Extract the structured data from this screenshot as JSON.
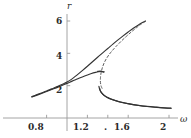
{
  "chart_data": {
    "type": "line",
    "title": "",
    "subtitle": "",
    "xlabel": "ω",
    "ylabel": "r",
    "xlim": [
      0.65,
      2.05
    ],
    "ylim": [
      0,
      6.9
    ],
    "grid": false,
    "legend": "none",
    "xticks": [
      0.8,
      1.2,
      1.4,
      1.6,
      2.0
    ],
    "xticklabels": [
      "0.8",
      "1.2",
      ".",
      "1.6",
      "2"
    ],
    "yticks": [
      2,
      4,
      6
    ],
    "yticklabels": [
      "2",
      "4",
      "6"
    ],
    "y_axis_at_x": 1.0,
    "x_axis_at_y": 0,
    "annotations": [],
    "series": [
      {
        "name": "lower-stable-branch",
        "style": "solid",
        "color": "#333333",
        "points": [
          [
            0.655,
            1.3
          ],
          [
            0.7,
            1.4
          ],
          [
            0.75,
            1.52
          ],
          [
            0.8,
            1.64
          ],
          [
            0.85,
            1.76
          ],
          [
            0.9,
            1.88
          ],
          [
            0.95,
            2.01
          ],
          [
            1.0,
            2.14
          ],
          [
            1.05,
            2.28
          ],
          [
            1.1,
            2.41
          ],
          [
            1.15,
            2.54
          ],
          [
            1.2,
            2.66
          ],
          [
            1.24,
            2.75
          ],
          [
            1.28,
            2.82
          ],
          [
            1.31,
            2.86
          ],
          [
            1.335,
            2.875
          ],
          [
            1.35,
            2.87
          ],
          [
            1.365,
            2.855
          ]
        ]
      },
      {
        "name": "upper-stable-branch",
        "style": "solid",
        "color": "#333333",
        "points": [
          [
            0.655,
            1.32
          ],
          [
            0.7,
            1.43
          ],
          [
            0.75,
            1.55
          ],
          [
            0.8,
            1.67
          ],
          [
            0.85,
            1.8
          ],
          [
            0.9,
            1.93
          ],
          [
            0.95,
            2.07
          ],
          [
            1.0,
            2.22
          ],
          [
            1.05,
            2.42
          ],
          [
            1.1,
            2.67
          ],
          [
            1.15,
            2.93
          ],
          [
            1.2,
            3.2
          ],
          [
            1.25,
            3.48
          ],
          [
            1.3,
            3.76
          ],
          [
            1.35,
            4.03
          ],
          [
            1.4,
            4.3
          ],
          [
            1.45,
            4.57
          ],
          [
            1.5,
            4.83
          ],
          [
            1.55,
            5.08
          ],
          [
            1.6,
            5.32
          ],
          [
            1.65,
            5.55
          ],
          [
            1.7,
            5.75
          ],
          [
            1.74,
            5.9
          ],
          [
            1.77,
            6.0
          ]
        ]
      },
      {
        "name": "unstable-dashed-branch",
        "style": "dashed",
        "color": "#555555",
        "points": [
          [
            1.77,
            5.98
          ],
          [
            1.73,
            5.82
          ],
          [
            1.68,
            5.58
          ],
          [
            1.63,
            5.32
          ],
          [
            1.58,
            5.04
          ],
          [
            1.53,
            4.74
          ],
          [
            1.48,
            4.42
          ],
          [
            1.44,
            4.14
          ],
          [
            1.41,
            3.9
          ],
          [
            1.385,
            3.66
          ],
          [
            1.365,
            3.42
          ],
          [
            1.35,
            3.18
          ],
          [
            1.34,
            2.96
          ],
          [
            1.332,
            2.72
          ],
          [
            1.328,
            2.48
          ],
          [
            1.327,
            2.28
          ],
          [
            1.33,
            2.1
          ],
          [
            1.336,
            1.95
          ],
          [
            1.345,
            1.82
          ]
        ]
      },
      {
        "name": "lower-fold-return-branch",
        "style": "solid",
        "color": "#333333",
        "points": [
          [
            1.32,
            1.84
          ],
          [
            1.325,
            1.72
          ],
          [
            1.335,
            1.6
          ],
          [
            1.35,
            1.48
          ],
          [
            1.37,
            1.37
          ],
          [
            1.4,
            1.26
          ],
          [
            1.44,
            1.15
          ],
          [
            1.49,
            1.05
          ],
          [
            1.55,
            0.95
          ],
          [
            1.62,
            0.86
          ],
          [
            1.7,
            0.78
          ],
          [
            1.79,
            0.71
          ],
          [
            1.88,
            0.66
          ],
          [
            1.96,
            0.62
          ],
          [
            2.02,
            0.6
          ]
        ]
      },
      {
        "name": "lower-fold-inner-branch",
        "style": "solid",
        "color": "#333333",
        "points": [
          [
            1.313,
            1.96
          ],
          [
            1.318,
            1.82
          ],
          [
            1.328,
            1.66
          ],
          [
            1.344,
            1.52
          ],
          [
            1.366,
            1.39
          ],
          [
            1.396,
            1.27
          ],
          [
            1.434,
            1.16
          ],
          [
            1.482,
            1.06
          ],
          [
            1.542,
            0.96
          ],
          [
            1.612,
            0.87
          ],
          [
            1.692,
            0.79
          ],
          [
            1.782,
            0.72
          ],
          [
            1.872,
            0.67
          ],
          [
            1.955,
            0.63
          ],
          [
            2.02,
            0.61
          ]
        ]
      },
      {
        "name": "short-upper-fold-tail",
        "style": "solid",
        "color": "#333333",
        "points": [
          [
            1.3,
            2.88
          ],
          [
            1.325,
            2.9
          ],
          [
            1.34,
            2.885
          ],
          [
            1.352,
            2.86
          ],
          [
            1.358,
            2.83
          ]
        ]
      }
    ]
  },
  "axes": {
    "y_axis_label": "r",
    "x_axis_label": "ω",
    "y_tick_6": "6",
    "y_tick_4": "4",
    "y_tick_2": "2",
    "x_tick_08": "0.8",
    "x_tick_12": "1.2",
    "x_tick_14": ".",
    "x_tick_16": "1.6",
    "x_tick_20": "2"
  },
  "colors": {
    "axis": "#9a9a9a",
    "curve_solid": "#333333",
    "curve_dashed": "#555555",
    "text": "#2b2b2b",
    "background": "#ffffff"
  }
}
